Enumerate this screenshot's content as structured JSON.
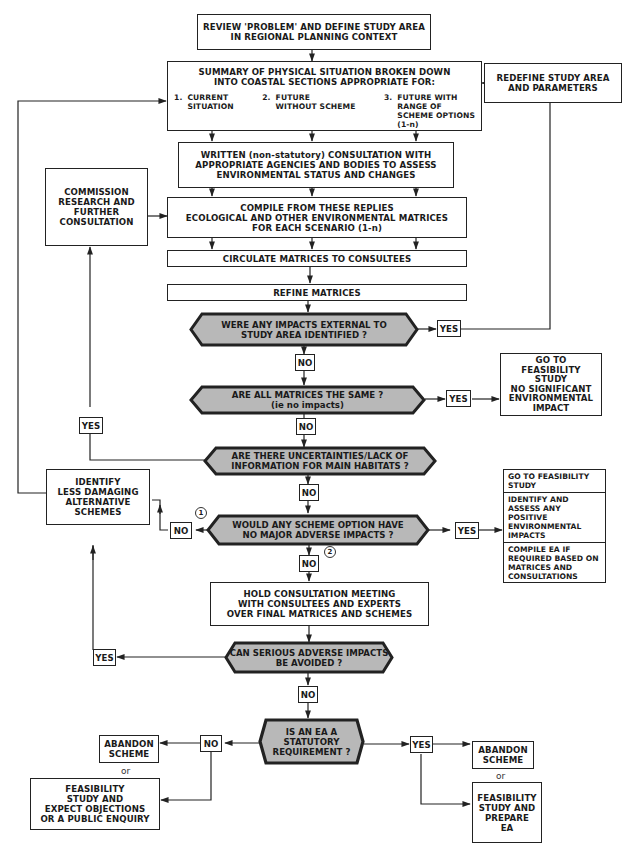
{
  "diagram": {
    "type": "flowchart",
    "colors": {
      "line": "#222222",
      "decision_fill": "#b8b8b8",
      "box_fill": "#ffffff"
    },
    "nodes": {
      "review": {
        "lines": [
          "REVIEW 'PROBLEM' AND DEFINE STUDY AREA",
          "IN REGIONAL PLANNING CONTEXT"
        ]
      },
      "summary": {
        "lines": [
          "SUMMARY OF PHYSICAL SITUATION BROKEN DOWN",
          "INTO COASTAL SECTIONS APPROPRIATE FOR:"
        ],
        "options": [
          {
            "num": "1.",
            "lines": [
              "CURRENT",
              "SITUATION"
            ]
          },
          {
            "num": "2.",
            "lines": [
              "FUTURE",
              "WITHOUT SCHEME"
            ]
          },
          {
            "num": "3.",
            "lines": [
              "FUTURE WITH",
              "RANGE OF",
              "SCHEME OPTIONS",
              "(1-n)"
            ]
          }
        ]
      },
      "redefine": {
        "lines": [
          "REDEFINE STUDY AREA",
          "AND PARAMETERS"
        ]
      },
      "written": {
        "lines": [
          "WRITTEN (non-statutory) CONSULTATION WITH",
          "APPROPRIATE AGENCIES AND BODIES TO ASSESS",
          "ENVIRONMENTAL STATUS AND CHANGES"
        ]
      },
      "commission": {
        "lines": [
          "COMMISSION",
          "RESEARCH AND",
          "FURTHER",
          "CONSULTATION"
        ]
      },
      "compile": {
        "lines": [
          "COMPILE FROM THESE REPLIES",
          "ECOLOGICAL AND OTHER ENVIRONMENTAL MATRICES",
          "FOR EACH SCENARIO (1-n)"
        ]
      },
      "circulate": {
        "lines": [
          "CIRCULATE MATRICES TO CONSULTEES"
        ]
      },
      "refine": {
        "lines": [
          "REFINE MATRICES"
        ]
      },
      "q_external": {
        "lines": [
          "WERE ANY IMPACTS EXTERNAL TO",
          "STUDY AREA IDENTIFIED ?"
        ]
      },
      "q_same": {
        "lines": [
          "ARE ALL MATRICES THE SAME ?",
          "(ie no impacts)"
        ]
      },
      "go_feasibility_none": {
        "lines": [
          "GO TO",
          "FEASIBILITY",
          "STUDY",
          "NO SIGNIFICANT",
          "ENVIRONMENTAL",
          "IMPACT"
        ]
      },
      "q_uncertain": {
        "lines": [
          "ARE THERE UNCERTAINTIES/LACK OF",
          "INFORMATION FOR MAIN HABITATS ?"
        ]
      },
      "identify_less": {
        "lines": [
          "IDENTIFY",
          "LESS DAMAGING",
          "ALTERNATIVE",
          "SCHEMES"
        ]
      },
      "q_no_major": {
        "lines": [
          "WOULD ANY SCHEME OPTION HAVE",
          "NO MAJOR ADVERSE IMPACTS ?"
        ]
      },
      "outcome_positive": {
        "cells": [
          [
            "GO TO",
            "FEASIBILITY",
            "STUDY"
          ],
          [
            "IDENTIFY AND",
            "ASSESS ANY",
            "POSITIVE",
            "ENVIRONMENTAL",
            "IMPACTS"
          ],
          [
            "COMPILE EA",
            "IF REQUIRED",
            "BASED ON MATRICES",
            "AND CONSULTATIONS"
          ]
        ]
      },
      "hold_meeting": {
        "lines": [
          "HOLD CONSULTATION MEETING",
          "WITH CONSULTEES AND EXPERTS",
          "OVER FINAL MATRICES AND SCHEMES"
        ]
      },
      "q_avoid": {
        "lines": [
          "CAN SERIOUS ADVERSE IMPACTS",
          "BE AVOIDED ?"
        ]
      },
      "q_statutory": {
        "lines": [
          "IS AN EA A",
          "STATUTORY",
          "REQUIREMENT ?"
        ]
      },
      "abandon_left": {
        "lines": [
          "ABANDON",
          "SCHEME"
        ]
      },
      "feasibility_objections": {
        "lines": [
          "FEASIBILITY",
          "STUDY AND",
          "EXPECT OBJECTIONS",
          "OR A PUBLIC ENQUIRY"
        ]
      },
      "abandon_right": {
        "lines": [
          "ABANDON",
          "SCHEME"
        ]
      },
      "feasibility_prepare": {
        "lines": [
          "FEASIBILITY",
          "STUDY AND",
          "PREPARE",
          "EA"
        ]
      }
    },
    "labels": {
      "yes": "YES",
      "no": "NO",
      "or": "or",
      "marker1": "1",
      "marker2": "2"
    }
  }
}
